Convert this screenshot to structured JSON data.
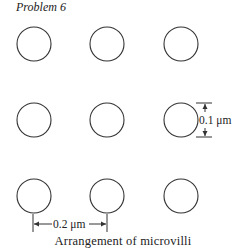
{
  "title": "Problem 6",
  "caption": "Arrangement of microvilli",
  "diagram": {
    "type": "grid-of-circles",
    "rows": 3,
    "columns": 3,
    "dimensions": {
      "diameter_label": "0.1 μm",
      "spacing_label": "0.2 μm"
    }
  }
}
